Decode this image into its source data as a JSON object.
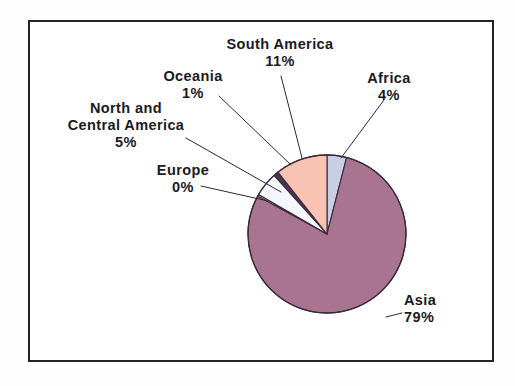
{
  "figure": {
    "background_color": "#ffffff",
    "frame_color": "#23232b",
    "text_color": "#1a1a1f"
  },
  "chart_data": {
    "type": "pie",
    "title": "",
    "subtitle": "",
    "xlabel": "",
    "ylabel": "",
    "legend_position": "none",
    "grid": false,
    "labels_show_percent": true,
    "start_angle_deg": 0,
    "direction": "clockwise",
    "categories": [
      "Africa",
      "Asia",
      "Europe",
      "North and Central America",
      "Oceania",
      "South America"
    ],
    "values": [
      4,
      79,
      0,
      5,
      1,
      11
    ],
    "units": "percent",
    "slices": [
      {
        "name": "Africa",
        "label": "Africa",
        "value": 4,
        "value_text": "4%",
        "color": "#c8cfe4",
        "start_deg": 0,
        "end_deg": 14.4
      },
      {
        "name": "Asia",
        "label": "Asia",
        "value": 79,
        "value_text": "79%",
        "color": "#a9748f",
        "start_deg": 14.4,
        "end_deg": 298.8
      },
      {
        "name": "Europe",
        "label": "Europe",
        "value": 0,
        "value_text": "0%",
        "color": "#f2f4f8",
        "start_deg": 298.8,
        "end_deg": 300.0
      },
      {
        "name": "North and Central America",
        "label": "North and\nCentral America",
        "value": 5,
        "value_text": "5%",
        "color": "#f4f7fb",
        "start_deg": 300.0,
        "end_deg": 318.0
      },
      {
        "name": "Oceania",
        "label": "Oceania",
        "value": 1,
        "value_text": "1%",
        "color": "#4c3550",
        "start_deg": 318.0,
        "end_deg": 321.6
      },
      {
        "name": "South America",
        "label": "South America",
        "value": 11,
        "value_text": "11%",
        "color": "#f8c3b2",
        "start_deg": 321.6,
        "end_deg": 360.0
      }
    ]
  },
  "labels": {
    "south_america": {
      "name": "South America",
      "value": "11%"
    },
    "oceania": {
      "name": "Oceania",
      "value": "1%"
    },
    "africa": {
      "name": "Africa",
      "value": "4%"
    },
    "north_america": {
      "name_line1": "North and",
      "name_line2": "Central America",
      "value": "5%"
    },
    "europe": {
      "name": "Europe",
      "value": "0%"
    },
    "asia": {
      "name": "Asia",
      "value": "79%"
    }
  }
}
